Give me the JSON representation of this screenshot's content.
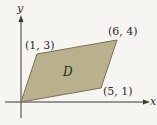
{
  "diagram": {
    "type": "parallelogram-region",
    "axes": {
      "x_label": "x",
      "y_label": "y"
    },
    "region_label": "D",
    "vertices": [
      {
        "label": "(0, 0)",
        "x": 0,
        "y": 0,
        "shown": false
      },
      {
        "label": "(1, 3)",
        "x": 1,
        "y": 3,
        "shown": true
      },
      {
        "label": "(6, 4)",
        "x": 6,
        "y": 4,
        "shown": true
      },
      {
        "label": "(5, 1)",
        "x": 5,
        "y": 1,
        "shown": true
      }
    ],
    "colors": {
      "fill": "#b9b08e",
      "edge": "#7a7150",
      "axis": "#3a3935",
      "background": "#f6f5f1"
    }
  }
}
